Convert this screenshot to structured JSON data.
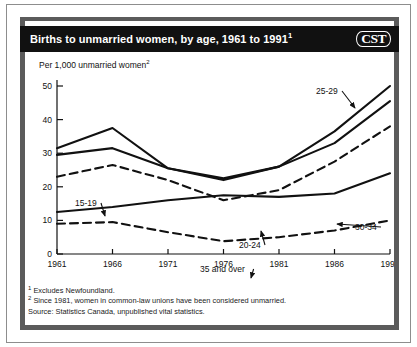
{
  "header": {
    "title": "Births to unmarried women, by age, 1961 to 1991",
    "title_footnote_marker": "1",
    "logo": "CST"
  },
  "axis_title": "Per 1,000 unmarried women",
  "axis_title_footnote_marker": "2",
  "footnotes": {
    "note1_marker": "1",
    "note1": "Excludes Newfoundland.",
    "note2_marker": "2",
    "note2": "Since 1981, women in common-law unions have been considered unmarried.",
    "source": "Source: Statistics Canada, unpublished vital statistics."
  },
  "colors": {
    "line": "#111111",
    "header_background": "#111111",
    "header_text": "#ffffff",
    "plate_border": "#5b5b5b",
    "outer_frame": "#8d8d8d",
    "page_background": "#ffffff"
  },
  "chart_data": {
    "type": "line",
    "title": "Births to unmarried women, by age, 1961 to 1991",
    "xlabel": "",
    "ylabel": "Per 1,000 unmarried women",
    "x": [
      1961,
      1966,
      1971,
      1976,
      1981,
      1986,
      1991
    ],
    "xtick_labels": [
      "1961",
      "1966",
      "1971",
      "1976",
      "1981",
      "1986",
      "1991"
    ],
    "ytick_labels": [
      "0",
      "10",
      "20",
      "30",
      "40",
      "50"
    ],
    "yticks": [
      0,
      10,
      20,
      30,
      40,
      50
    ],
    "xlim": [
      1961,
      1991
    ],
    "ylim": [
      0,
      50
    ],
    "grid": false,
    "legend": "inline-annotations",
    "series": [
      {
        "name": "25-29",
        "style": "solid",
        "label": "25-29",
        "values": [
          31.5,
          37.5,
          25.5,
          22.5,
          26.0,
          36.5,
          50.0
        ]
      },
      {
        "name": "20-24",
        "style": "solid",
        "label": "20-24",
        "values": [
          29.5,
          31.5,
          25.5,
          22.0,
          26.0,
          33.0,
          45.5
        ]
      },
      {
        "name": "30-34",
        "style": "dashed",
        "label": "30-34",
        "values": [
          23.0,
          26.5,
          22.0,
          16.0,
          19.0,
          27.5,
          38.0
        ]
      },
      {
        "name": "15-19",
        "style": "solid",
        "label": "15-19",
        "values": [
          12.5,
          14.0,
          16.0,
          17.5,
          17.0,
          18.0,
          24.0
        ]
      },
      {
        "name": "35 and over",
        "style": "dashed",
        "label": "35 and over",
        "values": [
          9.0,
          9.5,
          6.5,
          3.8,
          5.0,
          7.0,
          10.0
        ]
      }
    ]
  }
}
